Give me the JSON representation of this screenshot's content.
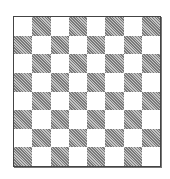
{
  "board": {
    "rows": 8,
    "cols": 8,
    "top_left_color": "light",
    "colors": {
      "light": "#ffffff",
      "dark": "#9a9a9a",
      "border": "#444444"
    }
  }
}
